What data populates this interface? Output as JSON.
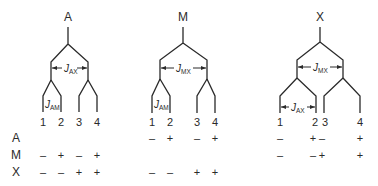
{
  "diagram": {
    "type": "NMR splitting tree diagrams (ABX-type spin system)",
    "trees": [
      {
        "id": "A",
        "title": "A",
        "couplings": [
          {
            "symbol": "J",
            "subscript": "AX",
            "level": "first"
          },
          {
            "symbol": "J",
            "subscript": "AM",
            "level": "second"
          }
        ],
        "lines": [
          "1",
          "2",
          "3",
          "4"
        ]
      },
      {
        "id": "M",
        "title": "M",
        "couplings": [
          {
            "symbol": "J",
            "subscript": "MX",
            "level": "first"
          },
          {
            "symbol": "J",
            "subscript": "AM",
            "level": "second"
          }
        ],
        "lines": [
          "1",
          "2",
          "3",
          "4"
        ]
      },
      {
        "id": "X",
        "title": "X",
        "couplings": [
          {
            "symbol": "J",
            "subscript": "MX",
            "level": "first"
          },
          {
            "symbol": "J",
            "subscript": "AX",
            "level": "second"
          }
        ],
        "lines": [
          "1",
          "2",
          "3",
          "4"
        ]
      }
    ],
    "row_labels": [
      "A",
      "M",
      "X"
    ],
    "spin_states": {
      "A_tree": {
        "A": [
          "",
          "",
          "",
          ""
        ],
        "M": [
          "–",
          "+",
          "–",
          "+"
        ],
        "X": [
          "–",
          "–",
          "+",
          "+"
        ]
      },
      "M_tree": {
        "A": [
          "–",
          "+",
          "–",
          "+"
        ],
        "M": [
          "",
          "",
          "",
          ""
        ],
        "X": [
          "–",
          "–",
          "+",
          "+"
        ]
      },
      "X_tree": {
        "A": [
          "–",
          "+",
          "–",
          "+"
        ],
        "M": [
          "–",
          "–",
          "+",
          "+"
        ],
        "X": [
          "",
          "",
          "",
          ""
        ]
      }
    }
  }
}
